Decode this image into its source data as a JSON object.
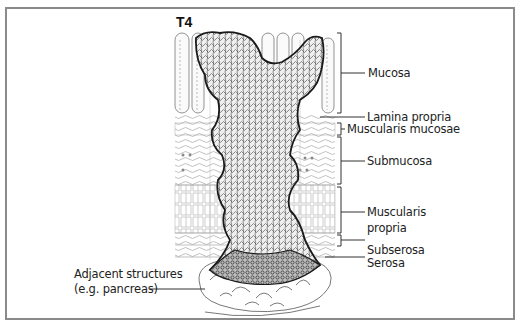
{
  "diagram": {
    "stage_title": "T4",
    "layer_labels": [
      {
        "id": "mucosa",
        "text": "Mucosa"
      },
      {
        "id": "lamina-propria",
        "text": "Lamina propria"
      },
      {
        "id": "muscularis-mucosae",
        "text": "Muscularis mucosae"
      },
      {
        "id": "submucosa",
        "text": "Submucosa"
      },
      {
        "id": "muscularis-propria-1",
        "text": "Muscularis"
      },
      {
        "id": "muscularis-propria-2",
        "text": "propria"
      },
      {
        "id": "subserosa",
        "text": "Subserosa"
      },
      {
        "id": "serosa",
        "text": "Serosa"
      }
    ],
    "adjacent_label": {
      "line1": "Adjacent structures",
      "line2": "(e.g. pancreas)"
    }
  },
  "colors": {
    "frame": "#8a8a8a",
    "ink": "#222222",
    "tumor_fill": "#d9d9d9",
    "tumor_edge": "#1a1a1a",
    "tissue_line": "#888888"
  }
}
